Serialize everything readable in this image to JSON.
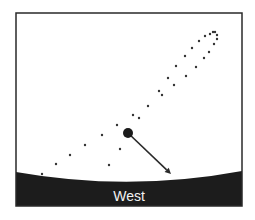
{
  "diagram": {
    "horizon_label": "West",
    "colors": {
      "frame": "#2a2a2a",
      "ground": "#1c1c1c",
      "sky": "#ffffff",
      "dots": "#333333",
      "planet": "#1a1a1a",
      "arrow": "#2a2a2a",
      "label": "#f2f2f2"
    },
    "frame": {
      "x": 16,
      "y": 13,
      "width": 226,
      "height": 193
    },
    "path_dots": [
      [
        42,
        174
      ],
      [
        56,
        164
      ],
      [
        70,
        155
      ],
      [
        85,
        145
      ],
      [
        102,
        135
      ],
      [
        117,
        125
      ],
      [
        133,
        115
      ],
      [
        148,
        106
      ],
      [
        159,
        91
      ],
      [
        168,
        78
      ],
      [
        176,
        66
      ],
      [
        185,
        56
      ],
      [
        192,
        48
      ],
      [
        199,
        41
      ],
      [
        205,
        36
      ],
      [
        210,
        34
      ],
      [
        213,
        32
      ],
      [
        215,
        32
      ],
      [
        217,
        35
      ],
      [
        217,
        39
      ],
      [
        214,
        44
      ],
      [
        209,
        52
      ],
      [
        204,
        58
      ],
      [
        196,
        67
      ],
      [
        186,
        76
      ],
      [
        174,
        85
      ],
      [
        162,
        95
      ],
      [
        139,
        118
      ],
      [
        120,
        149
      ],
      [
        109,
        165
      ]
    ],
    "planet": {
      "cx": 128,
      "cy": 133,
      "r": 5
    },
    "arrow": {
      "x1": 128,
      "y1": 133,
      "x2": 171,
      "y2": 174
    }
  }
}
